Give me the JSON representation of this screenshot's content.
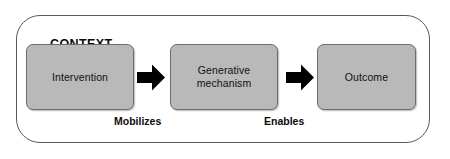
{
  "diagram": {
    "container": {
      "label": "CONTEXT",
      "border_color": "#595959",
      "fill_color": "#ffffff"
    },
    "node_fill_color": "#b9b9b9",
    "node_border_color": "#6d6d6d",
    "arrow_color": "#000000",
    "nodes": [
      {
        "id": "intervention",
        "label": "Intervention"
      },
      {
        "id": "generative-mechanism",
        "label": "Generative\nmechanism",
        "line1": "Generative",
        "line2": "mechanism"
      },
      {
        "id": "outcome",
        "label": "Outcome"
      }
    ],
    "edges": [
      {
        "id": "intervention-to-mechanism",
        "label": "Mobilizes",
        "icon": "right-block-arrow-icon"
      },
      {
        "id": "mechanism-to-outcome",
        "label": "Enables",
        "icon": "right-block-arrow-icon"
      }
    ]
  }
}
